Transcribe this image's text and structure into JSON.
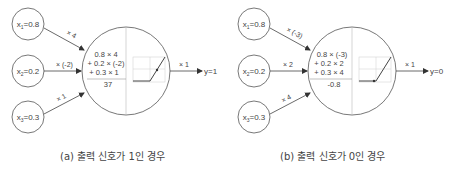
{
  "panels": [
    {
      "id": "a",
      "caption": "(a) 출력 신호가 1인 경우",
      "inputs": [
        {
          "name": "x",
          "sub": "1",
          "value": "=0.8",
          "weight": "× 4"
        },
        {
          "name": "x",
          "sub": "2",
          "value": "=0.2",
          "weight": "× (-2)"
        },
        {
          "name": "x",
          "sub": "3",
          "value": "=0.3",
          "weight": "× 1"
        }
      ],
      "sum_lines": [
        "0.8 × 4",
        "+ 0.2 × (-2)",
        "+ 0.3 × 1"
      ],
      "sum_result": "37",
      "output_weight": "× 1",
      "output": "y=1"
    },
    {
      "id": "b",
      "caption": "(b) 출력 신호가 0인 경우",
      "inputs": [
        {
          "name": "x",
          "sub": "1",
          "value": "=0.8",
          "weight": "× (-3)"
        },
        {
          "name": "x",
          "sub": "2",
          "value": "=0.2",
          "weight": "× 2"
        },
        {
          "name": "x",
          "sub": "3",
          "value": "=0.3",
          "weight": "× 4"
        }
      ],
      "sum_lines": [
        "0.8 × (-3)",
        "+ 0.2 × 2",
        "+ 0.3 × 4"
      ],
      "sum_result": "-0.8",
      "output_weight": "× 1",
      "output": "y=0"
    }
  ],
  "colors": {
    "stroke": "#555555",
    "grid": "#bbbbbb",
    "text": "#444444",
    "background": "#ffffff"
  }
}
